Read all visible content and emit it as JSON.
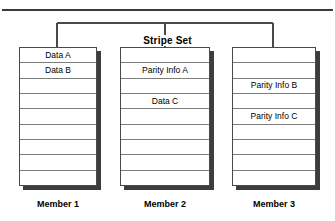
{
  "diagram": {
    "title": "Stripe Set",
    "rows_per_member": 9,
    "colors": {
      "rule": "#3a3a3a",
      "box_border": "#4a4a4a",
      "row_line": "#7c7c7c",
      "shadow": "#3d3d3d",
      "background": "#ffffff",
      "text": "#000000"
    },
    "bracket": {
      "label": "Stripe Set",
      "leg_x": [
        57,
        165,
        273
      ],
      "span_left": 57,
      "span_right": 273
    },
    "members": [
      {
        "label": "Member 1",
        "cells": [
          "Data A",
          "Data B",
          "",
          "",
          "",
          "",
          "",
          "",
          ""
        ]
      },
      {
        "label": "Member 2",
        "cells": [
          "",
          "Parity Info A",
          "",
          "Data C",
          "",
          "",
          "",
          "",
          ""
        ]
      },
      {
        "label": "Member 3",
        "cells": [
          "",
          "",
          "Parity Info B",
          "",
          "Parity Info C",
          "",
          "",
          "",
          ""
        ]
      }
    ]
  }
}
